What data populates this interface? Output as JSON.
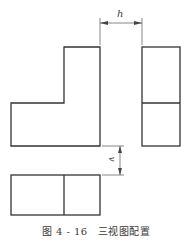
{
  "figure": {
    "number": "图 4 - 16",
    "title": "三视图配置"
  },
  "dimensions": {
    "horizontal_gap_label": "h",
    "vertical_gap_label": "v"
  },
  "views": {
    "front": {
      "shape": "L-shape",
      "divider": false
    },
    "side": {
      "shape": "rectangle",
      "divider": "horizontal"
    },
    "top": {
      "shape": "rectangle",
      "divider": "vertical"
    }
  },
  "colors": {
    "line": "#333333",
    "thin_line": "#555555",
    "background": "#ffffff"
  }
}
